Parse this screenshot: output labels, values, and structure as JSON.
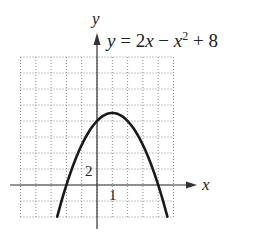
{
  "chart_data": {
    "type": "line",
    "title": "",
    "equation": "y = 2x − x² + 8",
    "xlabel": "x",
    "ylabel": "y",
    "xlim": [
      -5,
      5
    ],
    "ylim": [
      -4,
      16
    ],
    "grid": true,
    "grid_x_step": 1,
    "grid_y_step": 2,
    "tick_labels": [
      {
        "axis": "x",
        "value": 1,
        "label": "1"
      },
      {
        "axis": "y",
        "value": 2,
        "label": "2"
      }
    ],
    "series": [
      {
        "name": "y = 2x - x^2 + 8",
        "x": [
          -2.8,
          -2,
          -1,
          0,
          1,
          2,
          3,
          4,
          4.8
        ],
        "y": [
          -5.44,
          0,
          5,
          8,
          9,
          8,
          5,
          0,
          -5.44
        ]
      }
    ],
    "key_points": {
      "vertex": [
        1,
        9
      ],
      "y_intercept": [
        0,
        8
      ],
      "x_intercepts": [
        [
          -2,
          0
        ],
        [
          4,
          0
        ]
      ]
    }
  },
  "labels": {
    "x_axis": "x",
    "y_axis": "y",
    "tick_x": "1",
    "tick_y": "2",
    "eq_y": "y",
    "eq_eq": " = 2",
    "eq_x1": "x",
    "eq_minus": " − ",
    "eq_x2": "x",
    "eq_exp": "2",
    "eq_plus": " + 8"
  },
  "colors": {
    "curve": "#1a1a1a",
    "axis": "#333333",
    "grid": "#8a8a8a"
  }
}
